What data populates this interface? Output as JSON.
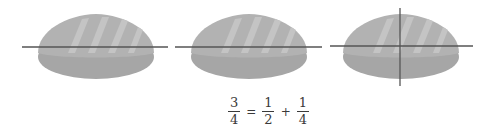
{
  "colors": {
    "bread_top": "#b0b0b0",
    "bread_bottom": "#a4a4a4",
    "bread_stripe": "#c6c6c6",
    "cut_line": "#555555",
    "text": "#3a3a3a"
  },
  "breads": [
    {
      "label": "bread-1",
      "cuts": [
        "horizontal"
      ]
    },
    {
      "label": "bread-2",
      "cuts": [
        "horizontal"
      ]
    },
    {
      "label": "bread-3",
      "cuts": [
        "horizontal",
        "vertical"
      ]
    }
  ],
  "equation": {
    "lhs": {
      "numerator": "3",
      "denominator": "4"
    },
    "equals": "=",
    "term1": {
      "numerator": "1",
      "denominator": "2"
    },
    "plus": "+",
    "term2": {
      "numerator": "1",
      "denominator": "4"
    }
  }
}
